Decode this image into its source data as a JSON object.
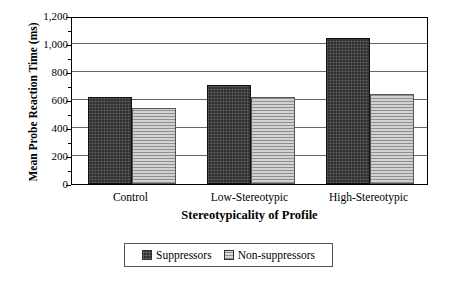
{
  "chart_data": {
    "type": "bar",
    "title": "",
    "xlabel": "Stereotypicality of Profile",
    "ylabel": "Mean Probe Reaction Time (ms)",
    "categories": [
      "Control",
      "Low-Stereotypic",
      "High-Stereotypic"
    ],
    "series": [
      {
        "name": "Suppressors",
        "values": [
          620,
          710,
          1040
        ],
        "color": "#303030",
        "pattern": "dark-crosshatch"
      },
      {
        "name": "Non-suppressors",
        "values": [
          540,
          620,
          640
        ],
        "color": "#b4b4b4",
        "pattern": "horizontal-lines"
      }
    ],
    "ylim": [
      0,
      1200
    ],
    "yticks": [
      0,
      200,
      400,
      600,
      800,
      1000,
      1200
    ],
    "ytick_labels": [
      "0",
      "200",
      "400",
      "600",
      "800",
      "1,000",
      "1,200"
    ],
    "grid": "horizontal",
    "legend_position": "bottom-center",
    "frame": true
  },
  "legend": {
    "items": [
      {
        "label": "Suppressors",
        "swatch": "dark-crosshatch-swatch"
      },
      {
        "label": "Non-suppressors",
        "swatch": "light-lines-swatch"
      }
    ]
  }
}
